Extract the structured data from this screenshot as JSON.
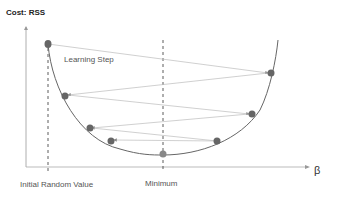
{
  "diagram": {
    "title": "Cost: RSS",
    "annotation": "Learning Step",
    "x_axis_label": "β",
    "markers": [
      {
        "label": "Initial Random Value"
      },
      {
        "label": "Minimum"
      }
    ],
    "colors": {
      "curve": "#666666",
      "point": "#666666",
      "arrow": "#b0b0b0",
      "axis": "#999999"
    }
  }
}
